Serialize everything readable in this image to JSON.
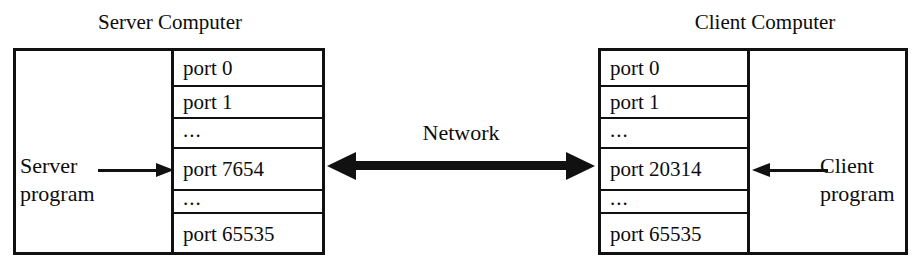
{
  "diagram": {
    "network_label": "Network",
    "server": {
      "title": "Server Computer",
      "program_line1": "Server",
      "program_line2": "program",
      "ports": [
        {
          "label": "port 0",
          "kind": "port"
        },
        {
          "label": "port 1",
          "kind": "port"
        },
        {
          "label": "...",
          "kind": "ellipsis"
        },
        {
          "label": "port 7654",
          "kind": "port"
        },
        {
          "label": "...",
          "kind": "ellipsis"
        },
        {
          "label": "port 65535",
          "kind": "port"
        }
      ],
      "active_port": "port 7654"
    },
    "client": {
      "title": "Client Computer",
      "program_line1": "Client",
      "program_line2": "program",
      "ports": [
        {
          "label": "port 0",
          "kind": "port"
        },
        {
          "label": "port 1",
          "kind": "port"
        },
        {
          "label": "...",
          "kind": "ellipsis"
        },
        {
          "label": "port 20314",
          "kind": "port"
        },
        {
          "label": "...",
          "kind": "ellipsis"
        },
        {
          "label": "port 65535",
          "kind": "port"
        }
      ],
      "active_port": "port 20314"
    },
    "colors": {
      "stroke": "#111111",
      "background": "#ffffff",
      "text": "#0d0d0d"
    }
  }
}
